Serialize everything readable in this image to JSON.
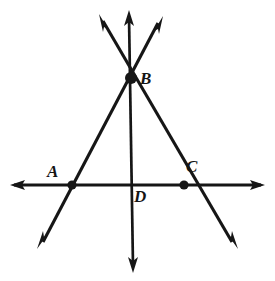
{
  "figure": {
    "kind": "geometry-diagram",
    "stroke_color": "#161616",
    "background_color": "#ffffff",
    "labels": [
      {
        "id": "label-a",
        "text": "A",
        "x": 47,
        "y": 163
      },
      {
        "id": "label-b",
        "text": "B",
        "x": 140,
        "y": 70
      },
      {
        "id": "label-c",
        "text": "C",
        "x": 186,
        "y": 158
      },
      {
        "id": "label-d",
        "text": "D",
        "x": 134,
        "y": 188
      }
    ],
    "points": [
      {
        "id": "point-a",
        "name": "A",
        "x": 72,
        "y": 185
      },
      {
        "id": "point-b",
        "name": "B",
        "x": 131,
        "y": 78
      },
      {
        "id": "point-c",
        "name": "C",
        "x": 184,
        "y": 185
      },
      {
        "id": "point-d",
        "name": "D",
        "x": 132,
        "y": 185
      }
    ],
    "lines": [
      {
        "id": "line-horizontal",
        "name": "horizontal-line-through-A-D-C",
        "from": {
          "x": 12,
          "y": 185
        },
        "to": {
          "x": 263,
          "y": 185
        },
        "arrow_start": true,
        "arrow_end": true
      },
      {
        "id": "line-vertical",
        "name": "vertical-line-through-B-D",
        "from": {
          "x": 129,
          "y": 14
        },
        "to": {
          "x": 133,
          "y": 269
        },
        "arrow_start": true,
        "arrow_end": true
      },
      {
        "id": "line-upper-left-to-lower-right",
        "name": "line-through-B-and-C",
        "from": {
          "x": 101,
          "y": 18
        },
        "to": {
          "x": 234,
          "y": 245
        },
        "arrow_start": true,
        "arrow_end": true
      },
      {
        "id": "line-upper-right-to-lower-left",
        "name": "line-through-B-and-A",
        "from": {
          "x": 160,
          "y": 20
        },
        "to": {
          "x": 41,
          "y": 245
        },
        "arrow_start": true,
        "arrow_end": true
      }
    ]
  }
}
